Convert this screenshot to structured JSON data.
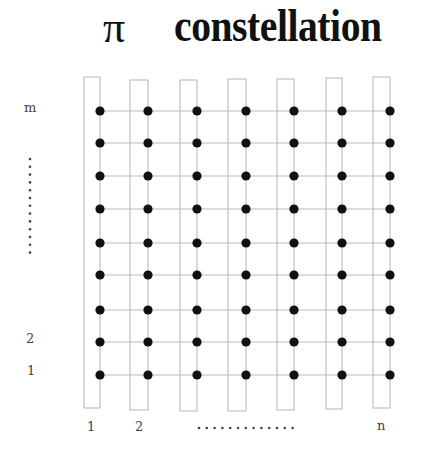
{
  "title": {
    "symbol": "π",
    "text": "constellation"
  },
  "axes": {
    "row_labels": {
      "top": "m",
      "second": "2",
      "first": "1"
    },
    "col_labels": {
      "first": "1",
      "second": "2",
      "last": "n"
    },
    "ellipsis": "ellipsis-dots"
  },
  "grid": {
    "columns": 7,
    "rows": 9,
    "column_x": [
      100,
      148,
      197,
      246,
      294,
      342,
      390
    ],
    "row_y": [
      111,
      143,
      176,
      209,
      243,
      275,
      310,
      342,
      375
    ],
    "rect_left": [
      84,
      130,
      180,
      228,
      277,
      326,
      373
    ],
    "rect_top": [
      77,
      80,
      80,
      79,
      79,
      78,
      77
    ],
    "rect_bottom": [
      408,
      410,
      411,
      411,
      410,
      409,
      408
    ],
    "dot_color": "#111111",
    "line_color": "#bbbbbb",
    "rect_color": "#b5b5b5"
  }
}
